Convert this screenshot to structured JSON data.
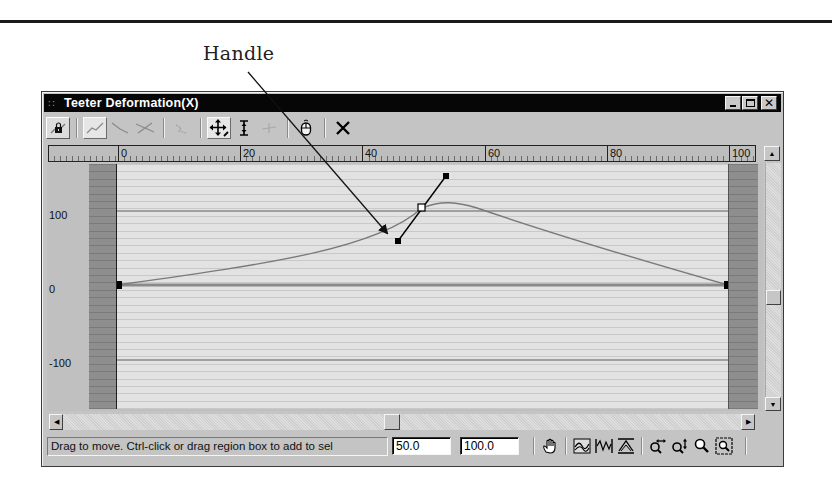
{
  "figure": {
    "callout_label": "Handle"
  },
  "window": {
    "title": "Teeter Deformation(X)",
    "title_grip_icon": "grip-dots-icon",
    "controls": {
      "minimize": "_",
      "maximize": "□",
      "close": "×"
    }
  },
  "toolbar": {
    "buttons": [
      {
        "name": "lock-selection-button",
        "icon": "lock-icon",
        "state": "normal"
      },
      {
        "name": "insert-corner-point-button",
        "icon": "curve-corner-icon",
        "state": "pressed"
      },
      {
        "name": "insert-bezier-point-button",
        "icon": "curve-line-icon",
        "state": "disabled"
      },
      {
        "name": "delete-point-button",
        "icon": "curve-x-icon",
        "state": "disabled"
      },
      {
        "name": "reset-curves-button",
        "icon": "curve-reset-icon",
        "state": "disabled"
      },
      {
        "name": "move-button",
        "icon": "move-arrows-icon",
        "state": "pressed"
      },
      {
        "name": "scale-point-button",
        "icon": "vertical-scale-icon",
        "state": "normal"
      },
      {
        "name": "insert-point-button",
        "icon": "insert-point-icon",
        "state": "disabled"
      },
      {
        "name": "reset-button",
        "icon": "mouse-icon",
        "state": "normal"
      },
      {
        "name": "delete-control-point-button",
        "icon": "x-icon",
        "state": "normal"
      }
    ]
  },
  "ruler": {
    "labels": [
      "0",
      "20",
      "40",
      "60",
      "80",
      "100"
    ]
  },
  "graph": {
    "y_labels": [
      "100",
      "0",
      "-100"
    ]
  },
  "status": {
    "prompt": "Drag to move. Ctrl-click or drag region box to add to sel",
    "x_value": "50.0",
    "y_value": "100.0",
    "nav_icons": [
      {
        "name": "pan-button",
        "icon": "hand-pan-icon"
      },
      {
        "name": "zoom-extents-button",
        "icon": "zoom-extents-icon"
      },
      {
        "name": "zoom-horizontal-extents-button",
        "icon": "zoom-horizontal-extents-icon"
      },
      {
        "name": "zoom-value-extents-button",
        "icon": "zoom-value-extents-icon"
      },
      {
        "name": "zoom-horizontally-button",
        "icon": "zoom-horizontal-icon"
      },
      {
        "name": "zoom-vertically-button",
        "icon": "zoom-vertical-icon"
      },
      {
        "name": "zoom-button",
        "icon": "magnifier-icon"
      },
      {
        "name": "zoom-region-button",
        "icon": "zoom-region-icon"
      }
    ]
  },
  "curve": {
    "points": [
      {
        "x": 0,
        "y": 0,
        "type": "corner"
      },
      {
        "x": 50,
        "y": 100,
        "type": "bezier",
        "selected": true,
        "in_handle": {
          "x": 46,
          "y": 60
        },
        "out_handle": {
          "x": 54,
          "y": 148
        }
      },
      {
        "x": 100,
        "y": 0,
        "type": "corner"
      }
    ],
    "x_range": [
      0,
      100
    ],
    "y_gridlines": [
      100,
      0,
      -100
    ]
  },
  "colors": {
    "titlebar": "#060606",
    "window_face": "#c4c4c4",
    "plot_bg": "#e2e2e2",
    "band": "#8e8e8e",
    "curve": "#7a7a7a"
  }
}
